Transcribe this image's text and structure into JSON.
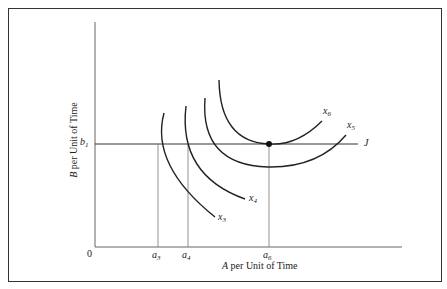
{
  "diagram": {
    "axes": {
      "origin_label": "0",
      "x_label_var": "A",
      "x_label_rest": " per Unit of Time",
      "y_label_var": "B",
      "y_label_rest": " per Unit of Time"
    },
    "ticks": {
      "b1": {
        "var": "b",
        "sub": "1"
      },
      "a3": {
        "var": "a",
        "sub": "3"
      },
      "a4": {
        "var": "a",
        "sub": "4"
      },
      "a6": {
        "var": "a",
        "sub": "6"
      }
    },
    "curves": {
      "x3": {
        "var": "x",
        "sub": "3"
      },
      "x4": {
        "var": "x",
        "sub": "4"
      },
      "x5": {
        "var": "x",
        "sub": "5"
      },
      "x6": {
        "var": "x",
        "sub": "6"
      }
    },
    "line_label": "J",
    "colors": {
      "line": "#222222",
      "axis": "#555555",
      "frame": "#333333"
    }
  }
}
